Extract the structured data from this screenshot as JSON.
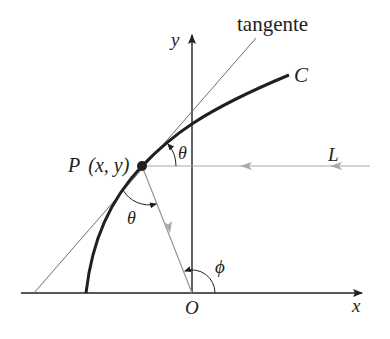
{
  "diagram": {
    "type": "geometry-reflection",
    "labels": {
      "tangent": "tangente",
      "curve": "C",
      "point": "P (x, y)",
      "point_name": "P",
      "point_coords": "(x, y)",
      "line": "L",
      "theta_upper": "θ",
      "theta_lower": "θ",
      "phi": "ϕ",
      "origin": "O",
      "x_axis": "x",
      "y_axis": "y"
    },
    "colors": {
      "axis": "#231f20",
      "curve": "#231f20",
      "tangent": "#6d6e71",
      "ray": "#939598",
      "arrow_gray": "#a7a9ac"
    },
    "elements": [
      {
        "name": "x-axis",
        "from": [
          21,
          293
        ],
        "to": [
          363,
          293
        ],
        "arrow": "end"
      },
      {
        "name": "y-axis",
        "from": [
          192,
          293
        ],
        "to": [
          192,
          34
        ],
        "arrow": "end"
      },
      {
        "name": "curve-C",
        "from": [
          86,
          293
        ],
        "through": [
          142,
          166
        ],
        "to": [
          289,
          75
        ]
      },
      {
        "name": "tangent-line",
        "from": [
          34,
          293
        ],
        "to": [
          256,
          38
        ]
      },
      {
        "name": "incoming-ray-L",
        "from": [
          370,
          166
        ],
        "to": [
          142,
          166
        ],
        "direction": "left"
      },
      {
        "name": "reflected-ray",
        "from": [
          142,
          166
        ],
        "to": [
          192,
          293
        ]
      }
    ]
  }
}
